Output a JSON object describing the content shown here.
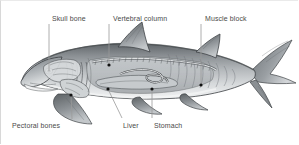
{
  "figure": {
    "background_color": "#ffffff",
    "label_color": "#4a4a4a",
    "leader_line_color": "#9a9a9a",
    "anchor_dot_color": "#111111",
    "body_fill": "#b9bcbf",
    "body_shadow": "#6d7276",
    "body_highlight": "#e4e6e8",
    "fin_fill": "#8d9195",
    "outline_color": "#3b3f42"
  },
  "labels": {
    "top": [
      {
        "id": "skull-bone",
        "text": "Skull bone",
        "x": 52,
        "y": 14
      },
      {
        "id": "vertebral-column",
        "text": "Vertebral column",
        "x": 113,
        "y": 14
      },
      {
        "id": "muscle-block",
        "text": "Muscle block",
        "x": 205,
        "y": 14
      }
    ],
    "bottom": [
      {
        "id": "pectoral-bones",
        "text": "Pectoral bones",
        "x": 12,
        "y": 121
      },
      {
        "id": "liver",
        "text": "Liver",
        "x": 123,
        "y": 121
      },
      {
        "id": "stomach",
        "text": "Stomach",
        "x": 154,
        "y": 121
      }
    ]
  },
  "leaders": [
    {
      "id": "leader-skull-bone",
      "x1": 49,
      "y1": 24,
      "x2": 49,
      "y2": 71
    },
    {
      "id": "leader-vertebral-column",
      "x1": 109,
      "y1": 24,
      "x2": 109,
      "y2": 65
    },
    {
      "id": "leader-muscle-block",
      "x1": 201,
      "y1": 24,
      "x2": 201,
      "y2": 85
    },
    {
      "id": "leader-pectoral-bones",
      "x1": 72,
      "y1": 119,
      "x2": 71,
      "y2": 95
    },
    {
      "id": "leader-liver",
      "x1": 122,
      "y1": 118,
      "x2": 108,
      "y2": 89
    },
    {
      "id": "leader-stomach",
      "x1": 152,
      "y1": 118,
      "x2": 152,
      "y2": 89
    }
  ],
  "anchor_dots": [
    {
      "id": "dot-skull-bone",
      "cx": 49,
      "cy": 71
    },
    {
      "id": "dot-vertebral-column",
      "cx": 109,
      "cy": 65
    },
    {
      "id": "dot-muscle-block",
      "cx": 201,
      "cy": 85
    },
    {
      "id": "dot-pectoral-bones",
      "cx": 71,
      "cy": 95
    },
    {
      "id": "dot-liver",
      "cx": 108,
      "cy": 89
    },
    {
      "id": "dot-stomach",
      "cx": 152,
      "cy": 89
    }
  ]
}
